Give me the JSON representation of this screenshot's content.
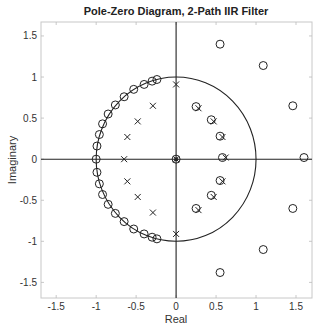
{
  "chart_data": {
    "type": "scatter",
    "title": "Pole-Zero Diagram, 2-Path IIR Filter",
    "xlabel": "Real",
    "ylabel": "Imaginary",
    "xlim": [
      -1.69,
      1.7
    ],
    "ylim": [
      -1.69,
      1.67
    ],
    "xticks": [
      -1.5,
      -1,
      -0.5,
      0,
      0.5,
      1,
      1.5
    ],
    "yticks": [
      -1.5,
      -1,
      -0.5,
      0,
      0.5,
      1,
      1.5
    ],
    "xtick_labels": [
      "-1.5",
      "-1",
      "-0.5",
      "0",
      "0.5",
      "1",
      "1.5"
    ],
    "ytick_labels": [
      "-1.5",
      "-1",
      "-0.5",
      "0",
      "0.5",
      "1",
      "1.5"
    ],
    "grid": false,
    "unit_circle": true,
    "series": [
      {
        "name": "zeros",
        "marker": "o",
        "points": [
          [
            -1.0,
            0.0
          ],
          [
            -0.99,
            0.16
          ],
          [
            -0.96,
            0.3
          ],
          [
            -0.92,
            0.43
          ],
          [
            -0.85,
            0.55
          ],
          [
            -0.76,
            0.66
          ],
          [
            -0.65,
            0.76
          ],
          [
            -0.53,
            0.85
          ],
          [
            -0.4,
            0.91
          ],
          [
            -0.3,
            0.95
          ],
          [
            -0.24,
            0.97
          ],
          [
            -0.99,
            -0.16
          ],
          [
            -0.96,
            -0.3
          ],
          [
            -0.92,
            -0.43
          ],
          [
            -0.85,
            -0.55
          ],
          [
            -0.76,
            -0.66
          ],
          [
            -0.65,
            -0.76
          ],
          [
            -0.53,
            -0.85
          ],
          [
            -0.4,
            -0.91
          ],
          [
            -0.3,
            -0.95
          ],
          [
            -0.24,
            -0.97
          ],
          [
            0.0,
            0.0
          ],
          [
            0.25,
            0.64
          ],
          [
            0.44,
            0.48
          ],
          [
            0.55,
            0.28
          ],
          [
            0.58,
            0.02
          ],
          [
            0.25,
            -0.6
          ],
          [
            0.44,
            -0.44
          ],
          [
            0.55,
            -0.26
          ],
          [
            0.55,
            1.4
          ],
          [
            1.09,
            1.14
          ],
          [
            1.46,
            0.65
          ],
          [
            1.6,
            0.02
          ],
          [
            0.55,
            -1.38
          ],
          [
            1.09,
            -1.1
          ],
          [
            1.46,
            -0.6
          ]
        ]
      },
      {
        "name": "poles",
        "marker": "x",
        "points": [
          [
            0.0,
            0.91
          ],
          [
            -0.29,
            0.65
          ],
          [
            -0.48,
            0.46
          ],
          [
            -0.61,
            0.27
          ],
          [
            -0.65,
            0.0
          ],
          [
            0.0,
            -0.91
          ],
          [
            -0.29,
            -0.65
          ],
          [
            -0.48,
            -0.46
          ],
          [
            -0.61,
            -0.27
          ],
          [
            0.0,
            0.0
          ],
          [
            0.28,
            0.62
          ],
          [
            0.47,
            0.46
          ],
          [
            0.58,
            0.27
          ],
          [
            0.62,
            0.02
          ],
          [
            0.28,
            -0.62
          ],
          [
            0.47,
            -0.46
          ],
          [
            0.58,
            -0.27
          ]
        ]
      }
    ]
  }
}
